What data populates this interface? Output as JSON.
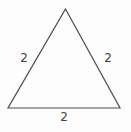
{
  "figure": {
    "type": "triangle-diagram",
    "labels": {
      "left_side": "2",
      "right_side": "2",
      "bottom_side": "2"
    },
    "colors": {
      "stroke": "#4c4c4c",
      "label_text": "#3f3f3f",
      "background": "#fdfdfd"
    }
  }
}
